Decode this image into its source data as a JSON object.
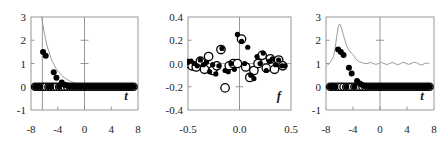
{
  "figure": {
    "panel_count": 3,
    "background": "#ffffff",
    "marker_fill_color": "#000000",
    "marker_open_color": "#ffffff",
    "curve_color": "#9a9a9a",
    "axis_color": "#8c8c8c",
    "text_color": "#1a1a1a"
  },
  "chart_data": [
    {
      "panel": 1,
      "type": "scatter",
      "title": "",
      "xlabel": "t",
      "ylabel": "",
      "xlim": [
        -8,
        8
      ],
      "ylim": [
        -1,
        3
      ],
      "xticks": [
        -8,
        -4,
        0,
        4,
        8
      ],
      "xticklabels": [
        "-8",
        "-4",
        "0",
        "4",
        "8"
      ],
      "yticks": [
        -1,
        0,
        1,
        2,
        3
      ],
      "yticklabels": [
        "-1",
        "0",
        "1",
        "2",
        "3"
      ],
      "grid": false,
      "legend": "none",
      "axis_lines": {
        "vertical_at_x": 0,
        "vertical_at_x_2": -6.3,
        "horizontal_at_y": 0
      },
      "inner_ticks_on_vaxis": [
        1,
        2
      ],
      "series": [
        {
          "name": "decaying exponential curve",
          "style": "line",
          "color": "#9a9a9a",
          "x": [
            -6.4,
            -6.2,
            -6.0,
            -5.8,
            -5.6,
            -5.4,
            -5.2,
            -5.0,
            -4.8,
            -4.6,
            -4.4,
            -4.2,
            -4.0,
            -3.8,
            -3.6,
            -3.4,
            -3.2,
            -3.0,
            -2.8,
            -2.6,
            -2.4,
            -2.2,
            -2.0,
            -1.6,
            -1.2,
            -0.8,
            0.0,
            1.0,
            2.0,
            3.0,
            4.0,
            5.0,
            6.0,
            7.0
          ],
          "y": [
            3.0,
            2.62,
            2.3,
            2.02,
            1.78,
            1.57,
            1.39,
            1.23,
            1.09,
            0.97,
            0.86,
            0.77,
            0.69,
            0.62,
            0.55,
            0.49,
            0.44,
            0.39,
            0.35,
            0.31,
            0.28,
            0.25,
            0.22,
            0.17,
            0.13,
            0.1,
            0.06,
            0.03,
            0.015,
            0.008,
            0.004,
            0.002,
            0.001,
            0.0
          ]
        },
        {
          "name": "filled circles",
          "style": "marker-filled",
          "color": "#000000",
          "x": [
            -7.4,
            -7.0,
            -6.6,
            -6.2,
            -5.8,
            -5.4,
            -5.0,
            -4.6,
            -4.2,
            -3.8,
            -3.4,
            -3.0,
            -2.6,
            -2.2,
            -1.8,
            -1.4,
            -1.0,
            -0.6,
            -0.2,
            0.2,
            0.6,
            1.0,
            1.4,
            1.8,
            2.2,
            2.6,
            3.0,
            3.4,
            3.8,
            4.2,
            4.6,
            5.0,
            5.4,
            5.8,
            6.2,
            6.6,
            7.0,
            7.35
          ],
          "y": [
            0.0,
            0.0,
            0.0,
            1.5,
            1.33,
            0.0,
            0.0,
            0.62,
            0.39,
            0.0,
            0.18,
            0.09,
            0.05,
            0.0,
            0.0,
            0.0,
            0.0,
            0.0,
            0.0,
            0.0,
            0.0,
            0.0,
            0.0,
            0.0,
            0.0,
            0.0,
            0.0,
            0.0,
            0.0,
            0.0,
            0.0,
            0.0,
            0.0,
            0.0,
            0.0,
            0.0,
            0.0,
            0.0
          ]
        },
        {
          "name": "open circles",
          "style": "marker-open",
          "color": "#000000",
          "x": [
            -7.4,
            -7.0,
            -6.6,
            -6.2,
            -5.8,
            -5.4,
            -5.0,
            -4.6,
            -4.2,
            -3.8,
            -3.4,
            -3.0,
            -2.6,
            -2.2,
            -1.8,
            -1.4,
            -1.0,
            -0.6,
            -0.2,
            0.2,
            0.6,
            1.0,
            1.4,
            1.8,
            2.2,
            2.6,
            3.0,
            3.4,
            3.8,
            4.2,
            4.6,
            5.0,
            5.4,
            5.8,
            6.2,
            6.6,
            7.0,
            7.35
          ],
          "y": [
            0,
            0,
            0,
            0,
            0,
            0,
            0,
            0,
            0,
            0,
            0,
            0,
            0,
            0,
            0,
            0,
            0,
            0,
            0,
            0,
            0,
            0,
            0,
            0,
            0,
            0,
            0,
            0,
            0,
            0,
            0,
            0,
            0,
            0,
            0,
            0,
            0,
            0
          ]
        }
      ]
    },
    {
      "panel": 2,
      "type": "scatter",
      "title": "",
      "xlabel": "f",
      "ylabel": "",
      "xlim": [
        -0.5,
        0.5
      ],
      "ylim": [
        -0.4,
        0.4
      ],
      "xticks": [
        -0.5,
        0.0,
        0.5
      ],
      "xticklabels": [
        "-0.5",
        "0.0",
        "0.5"
      ],
      "yticks": [
        -0.4,
        -0.2,
        0.0,
        0.2,
        0.4
      ],
      "yticklabels": [
        "-0.4",
        "-0.2",
        "0.0",
        "0.2",
        "0.4"
      ],
      "grid": false,
      "legend": "none",
      "axis_lines": {
        "vertical_at_x": 0,
        "horizontal_at_y": 0
      },
      "inner_ticks_on_vaxis": [
        -0.2
      ],
      "series": [
        {
          "name": "filled circles",
          "style": "marker-filled",
          "color": "#000000",
          "x": [
            -0.5,
            -0.47,
            -0.44,
            -0.41,
            -0.38,
            -0.35,
            -0.32,
            -0.29,
            -0.26,
            -0.23,
            -0.2,
            -0.17,
            -0.14,
            -0.11,
            -0.08,
            -0.05,
            -0.02,
            0.02,
            0.05,
            0.08,
            0.11,
            0.14,
            0.17,
            0.2,
            0.23,
            0.26,
            0.29,
            0.32,
            0.35,
            0.38,
            0.41,
            0.44
          ],
          "y": [
            0.01,
            0.02,
            0.0,
            -0.02,
            0.03,
            -0.01,
            0.01,
            -0.07,
            -0.01,
            -0.09,
            -0.02,
            0.13,
            -0.06,
            -0.07,
            0.0,
            -0.05,
            0.25,
            0.19,
            0.0,
            0.14,
            -0.1,
            -0.13,
            0.06,
            0.0,
            0.09,
            -0.06,
            0.02,
            0.04,
            -0.01,
            0.03,
            -0.02,
            -0.02
          ]
        },
        {
          "name": "open circles",
          "style": "marker-open",
          "color": "#000000",
          "x": [
            -0.5,
            -0.46,
            -0.42,
            -0.38,
            -0.34,
            -0.3,
            -0.26,
            -0.22,
            -0.18,
            -0.14,
            -0.1,
            -0.06,
            -0.02,
            0.02,
            0.06,
            0.1,
            0.14,
            0.18,
            0.22,
            0.26,
            0.3,
            0.34,
            0.38,
            0.42
          ],
          "y": [
            0.0,
            -0.02,
            -0.03,
            0.02,
            -0.05,
            0.06,
            -0.06,
            -0.02,
            0.12,
            -0.21,
            -0.02,
            0.0,
            0.0,
            0.21,
            -0.03,
            -0.12,
            -0.06,
            0.0,
            0.07,
            -0.04,
            0.04,
            -0.05,
            0.03,
            -0.02
          ]
        }
      ]
    },
    {
      "panel": 3,
      "type": "scatter",
      "title": "",
      "xlabel": "t",
      "ylabel": "",
      "xlim": [
        -8,
        8
      ],
      "ylim": [
        -1,
        3
      ],
      "xticks": [
        -8,
        -4,
        0,
        4,
        8
      ],
      "xticklabels": [
        "-8",
        "-4",
        "0",
        "4",
        "8"
      ],
      "yticks": [
        -1,
        0,
        1,
        2,
        3
      ],
      "yticklabels": [
        "-1",
        "0",
        "1",
        "2",
        "3"
      ],
      "grid": false,
      "legend": "none",
      "axis_lines": {
        "vertical_at_x": 0,
        "horizontal_at_y": 0
      },
      "inner_ticks_on_vaxis": [
        2
      ],
      "series": [
        {
          "name": "peaked oscillating curve",
          "style": "line",
          "color": "#9a9a9a",
          "x": [
            -7.8,
            -7.5,
            -7.2,
            -7.0,
            -6.8,
            -6.6,
            -6.4,
            -6.2,
            -6.0,
            -5.8,
            -5.6,
            -5.4,
            -5.2,
            -5.0,
            -4.8,
            -4.6,
            -4.4,
            -4.2,
            -4.0,
            -3.8,
            -3.6,
            -3.4,
            -3.2,
            -3.0,
            -2.6,
            -2.2,
            -1.8,
            -1.4,
            -1.0,
            -0.6,
            -0.2,
            0.2,
            0.6,
            1.0,
            1.4,
            1.8,
            2.2,
            2.6,
            3.0,
            3.4,
            3.8,
            4.2,
            4.6,
            5.0,
            5.4,
            5.8,
            6.2,
            6.6,
            7.0,
            7.3
          ],
          "y": [
            0.92,
            1.0,
            1.12,
            1.22,
            1.4,
            1.75,
            2.2,
            2.55,
            2.7,
            2.62,
            2.42,
            2.2,
            2.0,
            1.82,
            1.68,
            1.58,
            1.5,
            1.44,
            1.38,
            1.3,
            1.2,
            1.15,
            1.1,
            1.07,
            1.03,
            1.0,
            1.0,
            1.05,
            1.0,
            0.96,
            1.0,
            1.05,
            1.0,
            0.95,
            1.0,
            1.04,
            1.0,
            0.95,
            0.99,
            1.05,
            1.02,
            0.96,
            1.0,
            1.05,
            1.03,
            0.97,
            0.93,
            1.0,
            1.02,
            1.0
          ]
        },
        {
          "name": "filled circles",
          "style": "marker-filled",
          "color": "#000000",
          "x": [
            -7.4,
            -7.0,
            -6.6,
            -6.2,
            -5.8,
            -5.4,
            -5.0,
            -4.6,
            -4.2,
            -3.8,
            -3.4,
            -3.0,
            -2.6,
            -2.2,
            -1.8,
            -1.4,
            -1.0,
            -0.6,
            -0.2,
            0.2,
            0.6,
            1.0,
            1.4,
            1.8,
            2.2,
            2.6,
            3.0,
            3.4,
            3.8,
            4.2,
            4.6,
            5.0,
            5.4,
            5.8,
            6.2,
            6.6,
            7.0,
            7.35
          ],
          "y": [
            0.0,
            0.0,
            0.0,
            1.6,
            1.5,
            1.37,
            0.0,
            0.82,
            0.57,
            0.0,
            0.25,
            0.14,
            0.07,
            0.02,
            0.0,
            0.0,
            0.0,
            0.0,
            0.0,
            0.0,
            0.0,
            0.0,
            0.0,
            0.0,
            0.0,
            0.0,
            0.0,
            0.0,
            0.0,
            0.0,
            0.0,
            0.0,
            0.0,
            0.0,
            0.0,
            0.0,
            0.0,
            0.0
          ]
        },
        {
          "name": "open circles",
          "style": "marker-open",
          "color": "#000000",
          "x": [
            -7.4,
            -7.0,
            -6.6,
            -6.2,
            -5.8,
            -5.4,
            -5.0,
            -4.6,
            -4.2,
            -3.8,
            -3.4,
            -3.0,
            -2.6,
            -2.2,
            -1.8,
            -1.4,
            -1.0,
            -0.6,
            -0.2,
            0.2,
            0.6,
            1.0,
            1.4,
            1.8,
            2.2,
            2.6,
            3.0,
            3.4,
            3.8,
            4.2,
            4.6,
            5.0,
            5.4,
            5.8,
            6.2,
            6.6,
            7.0,
            7.35
          ],
          "y": [
            0,
            0,
            0,
            0,
            0,
            0,
            0,
            0,
            0,
            0,
            0,
            0,
            0,
            0,
            0,
            0,
            0,
            0,
            0,
            0,
            0,
            0,
            0,
            0,
            0,
            0,
            0,
            0,
            0,
            0,
            0,
            0,
            0,
            0,
            0,
            0,
            0,
            0
          ]
        }
      ]
    }
  ]
}
